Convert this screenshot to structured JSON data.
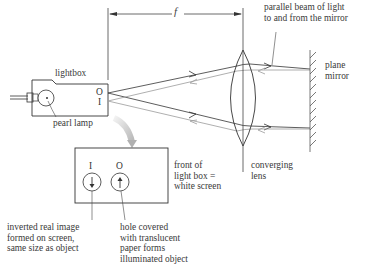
{
  "diagram": {
    "labels": {
      "focal_length": "f",
      "parallel_beam": [
        "parallel beam of light",
        "to and from the mirror"
      ],
      "plane_mirror": [
        "plane",
        "mirror"
      ],
      "lightbox": "lightbox",
      "pearl_lamp": "pearl lamp",
      "converging_lens": [
        "converging",
        "lens"
      ],
      "front_of_lightbox": [
        "front of",
        "light box =",
        "white screen"
      ],
      "inverted_image": [
        "inverted real image",
        "formed on screen,",
        "same size as object"
      ],
      "hole_covered": [
        "hole covered",
        "with translucent",
        "paper forms",
        "illuminated object"
      ]
    },
    "symbols": {
      "object": "O",
      "image": "I"
    },
    "components": [
      "lightbox",
      "pearl lamp",
      "converging lens",
      "plane mirror",
      "front screen view"
    ],
    "colors": {
      "line": "#333333",
      "return_ray": "#9a9a9a",
      "curved_arrow": "#c8c8c8"
    }
  }
}
